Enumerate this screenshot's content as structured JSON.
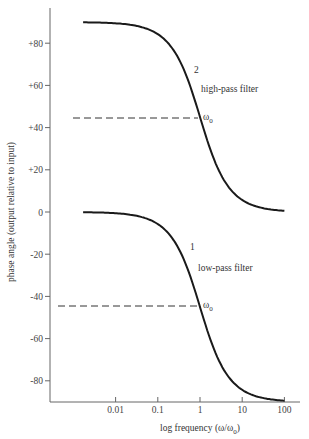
{
  "chart_data": {
    "type": "line",
    "title": "",
    "xlabel": "log frequency (ω/ω0)",
    "ylabel": "phase angle (output relative to input)",
    "x_scale": "log",
    "x_ticks": [
      "0.01",
      "0.1",
      "1",
      "10",
      "100"
    ],
    "x_tick_values": [
      0.01,
      0.1,
      1,
      10,
      100
    ],
    "xlim": [
      0.001,
      100
    ],
    "y_ticks": [
      "+80",
      "+60",
      "+40",
      "+20",
      "0",
      "-20",
      "-40",
      "-60",
      "-80"
    ],
    "y_tick_values": [
      80,
      60,
      40,
      20,
      0,
      -20,
      -40,
      -60,
      -80
    ],
    "ylim": [
      -90,
      100
    ],
    "grid": false,
    "legend": "none",
    "series": [
      {
        "name": "high-pass filter",
        "label_number": "2",
        "x": [
          0.001,
          0.01,
          0.1,
          0.3,
          1,
          3,
          10,
          100
        ],
        "values": [
          89.9,
          89.4,
          84.3,
          73.3,
          45,
          16.7,
          5.7,
          0.6
        ]
      },
      {
        "name": "low-pass filter",
        "label_number": "1",
        "x": [
          0.001,
          0.01,
          0.1,
          0.3,
          1,
          3,
          10,
          100
        ],
        "values": [
          -0.1,
          -0.6,
          -5.7,
          -16.7,
          -45,
          -73.3,
          -84.3,
          -89.4
        ]
      }
    ],
    "annotations": [
      {
        "text": "ω0",
        "x": 1,
        "y": 45,
        "dashed_line_from_x": 0.001
      },
      {
        "text": "ω0",
        "x": 1,
        "y": -45,
        "dashed_line_from_x": 0.001
      },
      {
        "text": "2",
        "near": "high-pass curve"
      },
      {
        "text": "high-pass filter",
        "near": "high-pass curve"
      },
      {
        "text": "1",
        "near": "low-pass curve"
      },
      {
        "text": "low-pass filter",
        "near": "low-pass curve"
      }
    ]
  },
  "labels": {
    "y_axis": "phase angle (output relative to input)",
    "x_axis_prefix": "log frequency (ω/ω",
    "x_axis_sub": "0",
    "x_axis_suffix": ")",
    "hp_number": "2",
    "hp_name": "high-pass filter",
    "lp_number": "1",
    "lp_name": "low-pass filter",
    "omega": "ω",
    "omega_sub": "0"
  }
}
